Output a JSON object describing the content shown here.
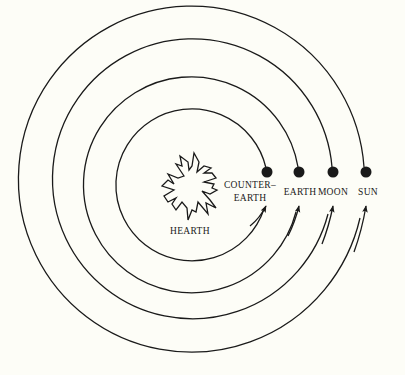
{
  "diagram": {
    "type": "concentric-orbits",
    "center": {
      "label": "HEARTH",
      "icon": "fire-icon"
    },
    "orbits": [
      {
        "label_line1": "COUNTER–",
        "label_line2": "EARTH",
        "radius": 76
      },
      {
        "label_line1": "EARTH",
        "label_line2": "",
        "radius": 108
      },
      {
        "label_line1": "MOON",
        "label_line2": "",
        "radius": 140
      },
      {
        "label_line1": "SUN",
        "label_line2": "",
        "radius": 173
      }
    ],
    "direction": "counter-clockwise arrows",
    "colors": {
      "background": "#fdfdf7",
      "ink": "#1a1a1a"
    }
  }
}
